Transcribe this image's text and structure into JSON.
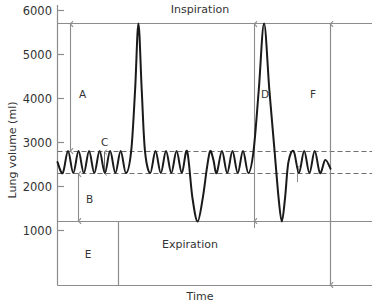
{
  "chart_data": {
    "type": "line",
    "title": "",
    "xlabel": "Time",
    "ylabel": "Lung volume (ml)",
    "ylim": [
      700,
      6250
    ],
    "yticks": [
      1000,
      2000,
      3000,
      4000,
      5000,
      6000
    ],
    "ytick_labels": [
      "1000",
      "2000",
      "3000",
      "4000",
      "5000",
      "6000"
    ],
    "xlim": [
      0,
      100
    ],
    "xticks": [],
    "xtick_labels": [],
    "grid": false,
    "legend": "none",
    "reference_lines": [
      {
        "name": "maximum-inspiration-line",
        "value": 5700,
        "style": "solid",
        "color": "#8c8c8c"
      },
      {
        "name": "tidal-peak-line",
        "value": 2800,
        "style": "dashed",
        "color": "#6e6e6e"
      },
      {
        "name": "tidal-trough-line",
        "value": 2300,
        "style": "dashed",
        "color": "#6e6e6e"
      },
      {
        "name": "residual-volume-line",
        "value": 1200,
        "style": "solid",
        "color": "#8c8c8c"
      }
    ],
    "series": [
      {
        "name": "Lung volume trace",
        "color": "#1a1a1a",
        "x": [
          0.0,
          1.6,
          3.2,
          4.8,
          6.4,
          8.0,
          9.6,
          11.2,
          12.8,
          14.4,
          16.0,
          17.6,
          19.2,
          20.8,
          22.4,
          23.6,
          24.6,
          25.6,
          26.6,
          28.2,
          29.8,
          31.4,
          33.0,
          34.6,
          36.2,
          37.8,
          39.4,
          41.0,
          42.6,
          44.2,
          45.4,
          46.4,
          47.4,
          48.4,
          50.0,
          51.6,
          53.2,
          54.8,
          56.4,
          58.0,
          59.6,
          61.2,
          62.8,
          64.4,
          66.0,
          67.2,
          68.2,
          69.2,
          70.2,
          71.8,
          73.4,
          75.0,
          76.6,
          78.2,
          79.8,
          81.4,
          83.0
        ],
        "y": [
          2550,
          2300,
          2800,
          2300,
          2800,
          2300,
          2800,
          2300,
          2800,
          2300,
          2800,
          2300,
          2800,
          2300,
          2800,
          4200,
          5700,
          4200,
          2800,
          2300,
          2800,
          2300,
          2800,
          2300,
          2800,
          2300,
          2800,
          1750,
          1200,
          1750,
          2400,
          2800,
          2600,
          2300,
          2800,
          2300,
          2800,
          2300,
          2800,
          2300,
          2800,
          4200,
          5700,
          4200,
          2800,
          1750,
          1200,
          1750,
          2550,
          2800,
          2300,
          2800,
          2300,
          2800,
          2300,
          2600,
          2400
        ]
      }
    ],
    "annotations": [
      {
        "name": "annotation-A",
        "label": "A",
        "from": 2800,
        "to": 5700,
        "kind": "double-arrow",
        "meaning": "inspiratory capacity"
      },
      {
        "name": "annotation-B",
        "label": "B",
        "from": 1200,
        "to": 2300,
        "kind": "double-arrow",
        "meaning": "expiratory reserve volume"
      },
      {
        "name": "annotation-C",
        "label": "C",
        "from": 2300,
        "to": 2800,
        "kind": "double-arrow",
        "meaning": "tidal volume"
      },
      {
        "name": "annotation-D",
        "label": "D",
        "from": 1200,
        "to": 5700,
        "kind": "double-arrow",
        "meaning": "vital capacity"
      },
      {
        "name": "annotation-E",
        "label": "E",
        "from": 0,
        "to": 0,
        "kind": "box",
        "meaning": "residual volume"
      },
      {
        "name": "annotation-F",
        "label": "F",
        "from": 700,
        "to": 5700,
        "kind": "double-arrow",
        "meaning": "total lung capacity"
      }
    ],
    "phase_labels": [
      {
        "name": "phase-label-inspiration",
        "label": "Inspiration"
      },
      {
        "name": "phase-label-expiration",
        "label": "Expiration"
      }
    ]
  },
  "axes": {
    "y_title": "Lung volume (ml)",
    "x_title": "Time",
    "y_tick_0": "1000",
    "y_tick_1": "2000",
    "y_tick_2": "3000",
    "y_tick_3": "4000",
    "y_tick_4": "5000",
    "y_tick_5": "6000"
  },
  "labels": {
    "A": "A",
    "B": "B",
    "C": "C",
    "D": "D",
    "E": "E",
    "F": "F",
    "inspiration": "Inspiration",
    "expiration": "Expiration"
  },
  "colors": {
    "trace": "#1a1a1a",
    "axis": "#8c8c8c",
    "dashed": "#6e6e6e",
    "arrow": "#8c8c8c",
    "text": "#333333",
    "background": "#ffffff"
  }
}
